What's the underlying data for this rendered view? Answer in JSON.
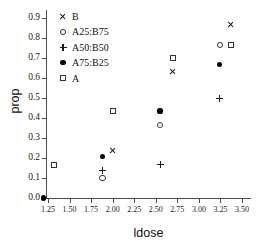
{
  "chart_data": {
    "type": "scatter",
    "title": "",
    "xlabel": "ldose",
    "ylabel": "prop",
    "xlim": [
      1.15,
      3.56
    ],
    "ylim": [
      -0.02,
      0.93
    ],
    "grid": false,
    "legend_position": "upper left (inside axes)",
    "x_ticks": [
      1.25,
      1.5,
      1.75,
      2.0,
      2.25,
      2.5,
      2.75,
      3.0,
      3.25,
      3.5
    ],
    "x_tick_labels": [
      "1.25",
      "1.50",
      "1.75",
      "2.00",
      "2.25",
      "2.50",
      "2.75",
      "3.00",
      "3.25",
      "3.50"
    ],
    "y_ticks": [
      0.0,
      0.1,
      0.2,
      0.3,
      0.4,
      0.5,
      0.6,
      0.7,
      0.8,
      0.9
    ],
    "y_tick_labels": [
      "0.0",
      "0.1",
      "0.2",
      "0.3",
      "0.4",
      "0.5",
      "0.6",
      "0.7",
      "0.8",
      "0.9"
    ],
    "series": [
      {
        "name": "B",
        "marker": "x",
        "color": "#1a1a1a",
        "x": [
          2.0,
          2.7,
          3.37
        ],
        "y": [
          0.235,
          0.633,
          0.867
        ]
      },
      {
        "name": "A25:B75",
        "marker": "o-open",
        "color": "#333333",
        "x": [
          1.88,
          2.55,
          3.24
        ],
        "y": [
          0.1,
          0.367,
          0.767
        ]
      },
      {
        "name": "A50:B50",
        "marker": "+",
        "color": "#1a1a1a",
        "x": [
          1.88,
          2.55,
          3.24
        ],
        "y": [
          0.14,
          0.17,
          0.5
        ]
      },
      {
        "name": "A75:B25",
        "marker": "o-filled",
        "color": "#000000",
        "x": [
          1.2,
          1.88,
          2.55,
          3.24
        ],
        "y": [
          0.0,
          0.208,
          0.435,
          0.667
        ]
      },
      {
        "name": "A",
        "marker": "s-open",
        "color": "#333333",
        "x": [
          1.32,
          2.0,
          2.7,
          3.37
        ],
        "y": [
          0.167,
          0.435,
          0.7,
          0.767
        ]
      }
    ]
  },
  "legend": {
    "entries": [
      {
        "label": "B",
        "marker": "cross"
      },
      {
        "label": "A25:B75",
        "marker": "circle-open"
      },
      {
        "label": "A50:B50",
        "marker": "plus"
      },
      {
        "label": "A75:B25",
        "marker": "circle-filled"
      },
      {
        "label": "A",
        "marker": "square-open"
      }
    ]
  },
  "axes": {
    "y_title": "prop",
    "x_title": "ldose"
  }
}
